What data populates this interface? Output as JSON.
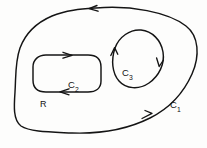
{
  "figure": {
    "background_color": "#fdfdfc",
    "stroke_color": "#141414",
    "labels": {
      "region": {
        "base": "R",
        "sub": ""
      },
      "outer_curve": {
        "base": "C",
        "sub": "1"
      },
      "inner_curve_left": {
        "base": "C",
        "sub": "2"
      },
      "inner_curve_right": {
        "base": "C",
        "sub": "3"
      }
    },
    "curves": [
      {
        "name": "C1",
        "role": "outer-boundary",
        "shape": "closed-blob",
        "orientation": "counterclockwise",
        "arrow_count": 2,
        "arrow_positions": [
          "top-edge-pointing-left",
          "bottom-right-edge-pointing-up-right"
        ]
      },
      {
        "name": "C2",
        "role": "inner-boundary-left-hole",
        "shape": "rounded-rectangle",
        "orientation": "clockwise",
        "arrow_count": 2,
        "arrow_positions": [
          "top-edge-pointing-right",
          "bottom-edge-pointing-left"
        ]
      },
      {
        "name": "C3",
        "role": "inner-boundary-right-hole",
        "shape": "tilted-oval",
        "orientation": "clockwise",
        "arrow_count": 2,
        "arrow_positions": [
          "left-side-pointing-up",
          "right-side-pointing-down"
        ]
      }
    ]
  }
}
